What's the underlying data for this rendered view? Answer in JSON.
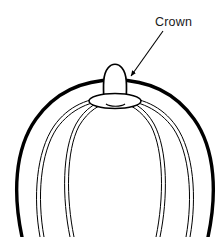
{
  "figure": {
    "background_color": "#ffffff",
    "ink_color": "#000000",
    "width": 222,
    "height": 237
  },
  "annotation": {
    "label": "Crown",
    "label_x": 155,
    "label_y": 26,
    "leader_line": {
      "from_x": 163,
      "from_y": 31,
      "to_x": 130,
      "to_y": 77
    },
    "arrowhead": {
      "x": 128,
      "y": 78,
      "shape": "filled-triangle"
    }
  },
  "object": {
    "name": "sphere-with-crown",
    "outline": {
      "name": "sphere-outline",
      "stroke_width": 3.2,
      "description": "thick outer arc of sphere, clipped at frame bottom"
    },
    "meridians": [
      {
        "name": "meridian-outer-left",
        "side": "left",
        "stroke_width": 1
      },
      {
        "name": "meridian-inner-left",
        "side": "left",
        "stroke_width": 1
      },
      {
        "name": "meridian-outer-right",
        "side": "right",
        "stroke_width": 1
      },
      {
        "name": "meridian-inner-right",
        "side": "right",
        "stroke_width": 1
      }
    ],
    "crown": {
      "name": "crown-finial",
      "base_plate": {
        "name": "crown-base-ellipse",
        "cx": 115,
        "cy": 101,
        "rx": 26,
        "ry": 7
      },
      "loop": {
        "name": "crown-loop",
        "cx": 115,
        "top_y": 64,
        "bottom_y": 101,
        "width": 22
      },
      "shank": {
        "name": "crown-shank",
        "cx": 115,
        "top_y": 72,
        "bottom_y": 104
      }
    }
  }
}
